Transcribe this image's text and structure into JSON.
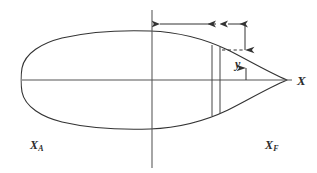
{
  "diagram": {
    "type": "technical-line-drawing",
    "stroke_color": "#333333",
    "background_color": "#ffffff",
    "labels": {
      "x_axis": "X",
      "x_aft": "X",
      "x_aft_sub": "A",
      "x_fwd": "X",
      "x_fwd_sub": "F",
      "y_offset": "y"
    },
    "geometry": {
      "centerline_y": 80,
      "axis_x_start": 22,
      "axis_x_end": 292,
      "midship_station_x": 152,
      "midship_line_top": 10,
      "midship_line_bottom": 168,
      "bow_tip_x": 287,
      "stern_x": 22,
      "half_beam_max": 48,
      "station_line_1_x": 212,
      "station_line_2_x": 220,
      "dimension_line_y": 24,
      "dimension_main_start_x": 152,
      "dimension_main_end_x": 224,
      "dimension_gap_start_x": 228,
      "dimension_gap_end_x": 243,
      "vertical_extension_x": 245,
      "vertical_arrow_top_y": 26,
      "vertical_arrow_bottom_y": 50,
      "dashed_link_start_x": 222,
      "dashed_link_end_x": 243,
      "dashed_link_y": 50,
      "y_arrow_up_x": 246,
      "y_arrow_up_from_y": 80,
      "y_arrow_up_to_y": 66
    }
  }
}
